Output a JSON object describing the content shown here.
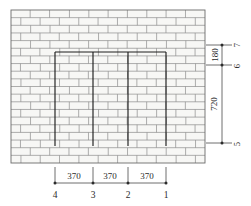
{
  "drawing": {
    "type": "masonry-wall-elevation",
    "title": "",
    "wall": {
      "fill_color": "#f7f7f5",
      "brick_line_color": "#8d8d8d",
      "outline_color": "#6a6a6a",
      "panel_line_color": "#1c1c1c",
      "courses": 20,
      "bond": "running-bond"
    },
    "dimension_color": "#4a4a4a"
  },
  "horizontal_dimensions": {
    "segments": [
      {
        "label": "370"
      },
      {
        "label": "370"
      },
      {
        "label": "370"
      }
    ],
    "stations": [
      {
        "label": "4"
      },
      {
        "label": "3"
      },
      {
        "label": "2"
      },
      {
        "label": "1"
      }
    ]
  },
  "vertical_dimensions": {
    "segments": [
      {
        "label": "180"
      },
      {
        "label": "720"
      }
    ],
    "markers": [
      {
        "label": "7"
      },
      {
        "label": "6"
      },
      {
        "label": "5"
      }
    ]
  }
}
